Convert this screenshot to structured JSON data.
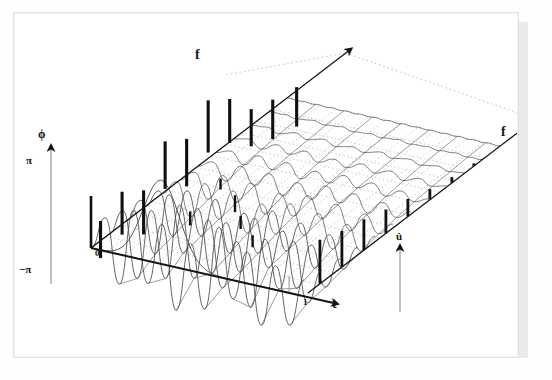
{
  "figure": {
    "title_visible": false,
    "axes": {
      "frequency_back": {
        "label": "f",
        "name": "frequency-axis-back"
      },
      "frequency_right": {
        "label": "f",
        "name": "frequency-axis-right"
      },
      "time": {
        "label": "t",
        "name": "time-axis",
        "ticks": [
          "1"
        ]
      },
      "phase": {
        "label": "ϕ",
        "name": "phase-axis",
        "tick_top": "π",
        "tick_bottom": "−π",
        "tick_origin": "0"
      },
      "magnitude": {
        "label": "û",
        "name": "magnitude-axis"
      }
    },
    "colors": {
      "ink": "#151515",
      "mesh": "#4a4a4a",
      "grid_dot": "#bdbdbd",
      "stem": "#101010",
      "page": "#ffffff",
      "shadow": "#d8d8d8"
    },
    "phase_stems": [
      {
        "u": 0.04,
        "top": 0.34,
        "bottom": -0.3
      },
      {
        "u": 0.13,
        "top": 0.56,
        "bottom": -0.18
      },
      {
        "u": 0.22,
        "top": 0.3,
        "bottom": -0.46
      },
      {
        "u": 0.31,
        "top": 0.86,
        "bottom": 0.04
      },
      {
        "u": 0.4,
        "top": 0.62,
        "bottom": -0.2
      },
      {
        "u": 0.49,
        "top": 1.0,
        "bottom": 0.1
      },
      {
        "u": 0.58,
        "top": 0.74,
        "bottom": -0.02
      },
      {
        "u": 0.67,
        "top": 0.28,
        "bottom": -0.36
      },
      {
        "u": 0.76,
        "top": 0.16,
        "bottom": -0.52
      },
      {
        "u": 0.86,
        "top": 0.06,
        "bottom": -0.62
      }
    ],
    "magnitude_stems": [
      {
        "u": 0.06,
        "h": 1.0
      },
      {
        "u": 0.17,
        "h": 0.82
      },
      {
        "u": 0.28,
        "h": 0.7
      },
      {
        "u": 0.39,
        "h": 0.54
      },
      {
        "u": 0.5,
        "h": 0.4
      },
      {
        "u": 0.61,
        "h": 0.24
      },
      {
        "u": 0.72,
        "h": 0.13
      },
      {
        "u": 0.83,
        "h": 0.06
      }
    ],
    "waterfall_rows": 12,
    "waterfall_note": "front rows strongly oscillatory, rear rows nearly flat"
  },
  "chart_data": {
    "type": "line",
    "title": "",
    "xlabel": "t",
    "ylabel": "û / ϕ",
    "zlabel": "f",
    "grid": true,
    "legend": null,
    "xlim": [
      0,
      1
    ],
    "phase_ylim": [
      -3.14159,
      3.14159
    ],
    "phase_tick_labels": [
      "π",
      "0",
      "−π"
    ],
    "time_tick_labels": [
      "0",
      "1"
    ],
    "series": [
      {
        "name": "row-1 (f = lowest)",
        "amplitude": 1.0,
        "values": [
          0.0,
          0.62,
          -0.55,
          0.88,
          -0.42,
          0.74,
          -0.8,
          0.5,
          -0.66,
          0.92,
          -0.35,
          0.58,
          -0.72,
          0.44,
          -0.6,
          0.3
        ]
      },
      {
        "name": "row-2",
        "amplitude": 0.88,
        "values": [
          0.0,
          0.5,
          -0.7,
          0.62,
          -0.58,
          0.84,
          -0.46,
          0.68,
          -0.52,
          0.4,
          -0.76,
          0.56,
          -0.3,
          0.64,
          -0.44,
          0.22
        ]
      },
      {
        "name": "row-3",
        "amplitude": 0.72,
        "values": [
          0.0,
          0.44,
          -0.5,
          0.66,
          -0.36,
          0.52,
          -0.62,
          0.38,
          -0.48,
          0.58,
          -0.28,
          0.46,
          -0.54,
          0.32,
          -0.4,
          0.18
        ]
      },
      {
        "name": "row-4",
        "amplitude": 0.58,
        "values": [
          0.0,
          0.36,
          -0.42,
          0.48,
          -0.3,
          0.44,
          -0.5,
          0.3,
          -0.38,
          0.46,
          -0.22,
          0.36,
          -0.42,
          0.26,
          -0.32,
          0.14
        ]
      },
      {
        "name": "row-5",
        "amplitude": 0.44,
        "values": [
          0.0,
          0.28,
          -0.32,
          0.36,
          -0.24,
          0.34,
          -0.38,
          0.22,
          -0.28,
          0.34,
          -0.18,
          0.28,
          -0.32,
          0.2,
          -0.24,
          0.1
        ]
      },
      {
        "name": "row-6",
        "amplitude": 0.32,
        "values": [
          0.0,
          0.2,
          -0.24,
          0.26,
          -0.18,
          0.24,
          -0.28,
          0.16,
          -0.2,
          0.24,
          -0.13,
          0.2,
          -0.23,
          0.14,
          -0.17,
          0.07
        ]
      },
      {
        "name": "row-7",
        "amplitude": 0.22,
        "values": [
          0.0,
          0.14,
          -0.16,
          0.18,
          -0.12,
          0.16,
          -0.19,
          0.11,
          -0.14,
          0.17,
          -0.09,
          0.14,
          -0.16,
          0.1,
          -0.12,
          0.05
        ]
      },
      {
        "name": "row-8",
        "amplitude": 0.15,
        "values": [
          0.0,
          0.09,
          -0.11,
          0.12,
          -0.08,
          0.11,
          -0.13,
          0.07,
          -0.09,
          0.11,
          -0.06,
          0.09,
          -0.1,
          0.06,
          -0.08,
          0.03
        ]
      },
      {
        "name": "row-9",
        "amplitude": 0.09,
        "values": [
          0.0,
          0.06,
          -0.07,
          0.07,
          -0.05,
          0.07,
          -0.08,
          0.04,
          -0.06,
          0.07,
          -0.04,
          0.06,
          -0.06,
          0.04,
          -0.05,
          0.02
        ]
      },
      {
        "name": "row-10",
        "amplitude": 0.05,
        "values": [
          0.0,
          0.03,
          -0.04,
          0.04,
          -0.03,
          0.04,
          -0.04,
          0.02,
          -0.03,
          0.04,
          -0.02,
          0.03,
          -0.03,
          0.02,
          -0.03,
          0.01
        ]
      },
      {
        "name": "row-11",
        "amplitude": 0.02,
        "values": [
          0.0,
          0.01,
          -0.02,
          0.02,
          -0.01,
          0.02,
          -0.02,
          0.01,
          -0.01,
          0.02,
          -0.01,
          0.01,
          -0.01,
          0.01,
          -0.01,
          0.0
        ]
      },
      {
        "name": "row-12 (f = highest)",
        "amplitude": 0.0,
        "values": [
          0,
          0,
          0,
          0,
          0,
          0,
          0,
          0,
          0,
          0,
          0,
          0,
          0,
          0,
          0,
          0
        ]
      }
    ],
    "gaussian_dip": {
      "name": "time-domain Gaussian dip",
      "center": 0.33,
      "depth": -1.0,
      "width": 0.12
    },
    "phase_stem_values": [
      0.34,
      0.56,
      0.3,
      0.86,
      0.62,
      1.0,
      0.74,
      0.28,
      0.16,
      0.06
    ],
    "magnitude_stem_values": [
      1.0,
      0.82,
      0.7,
      0.54,
      0.4,
      0.24,
      0.13,
      0.06
    ]
  }
}
